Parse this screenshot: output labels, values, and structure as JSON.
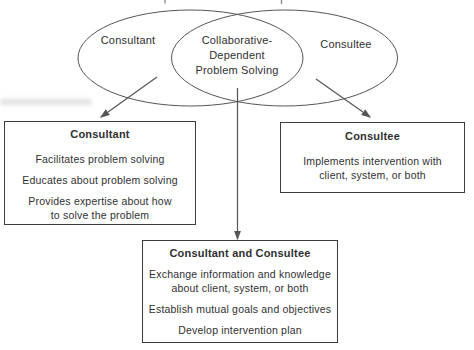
{
  "colors": {
    "ink": "#2f2f2f",
    "line": "#555555",
    "border": "#3d3d3d",
    "background": "#ffffff"
  },
  "venn": {
    "left_label": "Consultant",
    "center_label": "Collaborative-\nDependent\nProblem Solving",
    "right_label": "Consultee"
  },
  "boxes": [
    {
      "title": "Consultant",
      "items": [
        "Facilitates problem solving",
        "Educates about problem solving",
        "Provides expertise about how\nto solve the problem"
      ]
    },
    {
      "title": "Consultee",
      "items": [
        "Implements intervention with\nclient, system, or both"
      ]
    },
    {
      "title": "Consultant and Consultee",
      "items": [
        "Exchange information and knowledge\nabout client, system, or both",
        "Establish mutual goals and objectives",
        "Develop intervention plan"
      ]
    }
  ]
}
